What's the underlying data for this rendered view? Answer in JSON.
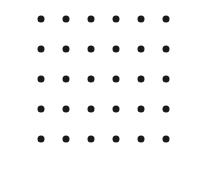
{
  "figure": {
    "kind": "dot-grid",
    "width": 205,
    "height": 172,
    "background_color": "#ffffff",
    "dot_color": "#1a1a1a",
    "dot_diameter": 7,
    "columns": 6,
    "rows": 5,
    "total_dots": 30,
    "column_spacing": 25,
    "row_spacing": 30,
    "column_centers_x": [
      41,
      66,
      91,
      116,
      141,
      166
    ],
    "row_centers_y": [
      19,
      49,
      79,
      109,
      139
    ],
    "dots": [
      {
        "row": 0,
        "col": 0,
        "x": 41,
        "y": 19
      },
      {
        "row": 0,
        "col": 1,
        "x": 66,
        "y": 19
      },
      {
        "row": 0,
        "col": 2,
        "x": 91,
        "y": 19
      },
      {
        "row": 0,
        "col": 3,
        "x": 116,
        "y": 19
      },
      {
        "row": 0,
        "col": 4,
        "x": 141,
        "y": 19
      },
      {
        "row": 0,
        "col": 5,
        "x": 166,
        "y": 19
      },
      {
        "row": 1,
        "col": 0,
        "x": 41,
        "y": 49
      },
      {
        "row": 1,
        "col": 1,
        "x": 66,
        "y": 49
      },
      {
        "row": 1,
        "col": 2,
        "x": 91,
        "y": 49
      },
      {
        "row": 1,
        "col": 3,
        "x": 116,
        "y": 49
      },
      {
        "row": 1,
        "col": 4,
        "x": 141,
        "y": 49
      },
      {
        "row": 1,
        "col": 5,
        "x": 166,
        "y": 49
      },
      {
        "row": 2,
        "col": 0,
        "x": 41,
        "y": 79
      },
      {
        "row": 2,
        "col": 1,
        "x": 66,
        "y": 79
      },
      {
        "row": 2,
        "col": 2,
        "x": 91,
        "y": 79
      },
      {
        "row": 2,
        "col": 3,
        "x": 116,
        "y": 79
      },
      {
        "row": 2,
        "col": 4,
        "x": 141,
        "y": 79
      },
      {
        "row": 2,
        "col": 5,
        "x": 166,
        "y": 79
      },
      {
        "row": 3,
        "col": 0,
        "x": 41,
        "y": 109
      },
      {
        "row": 3,
        "col": 1,
        "x": 66,
        "y": 109
      },
      {
        "row": 3,
        "col": 2,
        "x": 91,
        "y": 109
      },
      {
        "row": 3,
        "col": 3,
        "x": 116,
        "y": 109
      },
      {
        "row": 3,
        "col": 4,
        "x": 141,
        "y": 109
      },
      {
        "row": 3,
        "col": 5,
        "x": 166,
        "y": 109
      },
      {
        "row": 4,
        "col": 0,
        "x": 41,
        "y": 139
      },
      {
        "row": 4,
        "col": 1,
        "x": 66,
        "y": 139
      },
      {
        "row": 4,
        "col": 2,
        "x": 91,
        "y": 139
      },
      {
        "row": 4,
        "col": 3,
        "x": 116,
        "y": 139
      },
      {
        "row": 4,
        "col": 4,
        "x": 141,
        "y": 139
      },
      {
        "row": 4,
        "col": 5,
        "x": 166,
        "y": 139
      }
    ]
  }
}
